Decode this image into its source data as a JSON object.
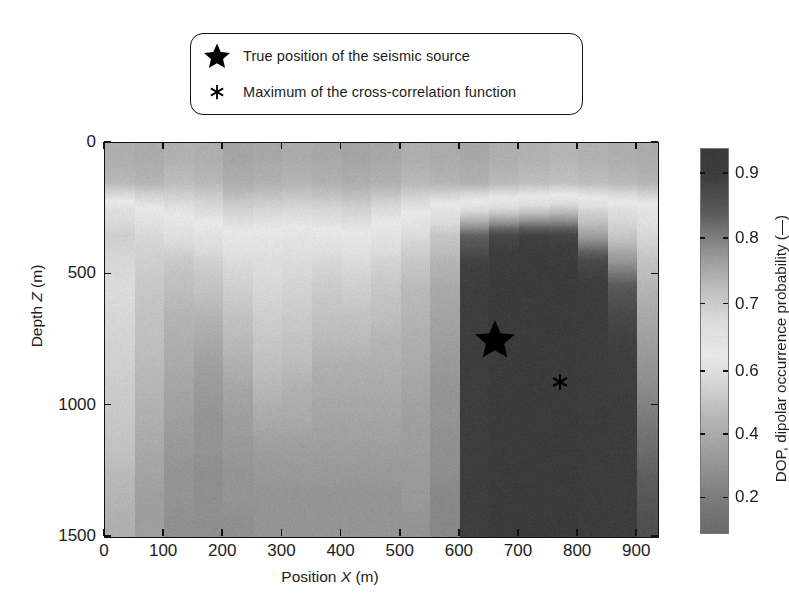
{
  "figure": {
    "legend": {
      "items": [
        {
          "symbol": "star-marker",
          "label": "True position of the seismic source"
        },
        {
          "symbol": "asterisk-marker",
          "label": "Maximum of the cross-correlation function"
        }
      ]
    }
  },
  "chart_data": {
    "type": "heatmap",
    "title": "",
    "xlabel": "Position X (m)",
    "ylabel": "Depth Z (m)",
    "xlabel_prefix": "Position ",
    "xlabel_var": "X",
    "xlabel_unit": " (m)",
    "ylabel_prefix": "Depth ",
    "ylabel_var": "Z",
    "ylabel_unit": " (m)",
    "xlim": [
      0,
      935
    ],
    "ylim": [
      0,
      1500
    ],
    "y_inverted": true,
    "grid": false,
    "xticks": [
      0,
      100,
      200,
      300,
      400,
      500,
      600,
      700,
      800,
      900
    ],
    "xticklabels": [
      "0",
      "100",
      "200",
      "300",
      "400",
      "500",
      "600",
      "700",
      "800",
      "900"
    ],
    "yticks": [
      0,
      500,
      1000,
      1500
    ],
    "yticklabels": [
      "0",
      "500",
      "1000",
      "1500"
    ],
    "colorbar": {
      "label": "DOP, dipolar occurrence probability (—)",
      "ticks": [
        0.9,
        0.8,
        0.7,
        0.6,
        0.4,
        0.2
      ],
      "ticklabels": [
        "0.9",
        "0.8",
        "0.7",
        "0.6",
        "0.4",
        "0.2"
      ],
      "tick_positions_frac": [
        0.065,
        0.235,
        0.405,
        0.58,
        0.745,
        0.91
      ],
      "vmin": 0.1,
      "vmax": 0.95,
      "colormap": "inverted-gray-nonmonotonic",
      "stops": [
        {
          "pos": 0.0,
          "hex": "#3a3a3a"
        },
        {
          "pos": 0.07,
          "hex": "#3d3d3d"
        },
        {
          "pos": 0.17,
          "hex": "#5c5c5c"
        },
        {
          "pos": 0.26,
          "hex": "#8f8f8f"
        },
        {
          "pos": 0.36,
          "hex": "#bdbdbd"
        },
        {
          "pos": 0.45,
          "hex": "#dcdcdc"
        },
        {
          "pos": 0.54,
          "hex": "#e8e8e8"
        },
        {
          "pos": 0.62,
          "hex": "#d2d2d2"
        },
        {
          "pos": 0.71,
          "hex": "#b3b3b3"
        },
        {
          "pos": 0.8,
          "hex": "#9b9b9b"
        },
        {
          "pos": 0.9,
          "hex": "#7e7e7e"
        },
        {
          "pos": 1.0,
          "hex": "#6a6a6a"
        }
      ]
    },
    "x_bin_edges": [
      0,
      50,
      100,
      150,
      200,
      250,
      300,
      350,
      400,
      450,
      500,
      550,
      600,
      650,
      700,
      750,
      800,
      850,
      900,
      935
    ],
    "z_bin_edges": [
      0,
      100,
      200,
      300,
      400,
      500,
      600,
      700,
      800,
      900,
      1000,
      1100,
      1200,
      1300,
      1400,
      1500
    ],
    "values": [
      [
        0.33,
        0.32,
        0.34,
        0.33,
        0.3,
        0.31,
        0.32,
        0.31,
        0.3,
        0.31,
        0.33,
        0.32,
        0.31,
        0.33,
        0.34,
        0.35,
        0.34,
        0.33,
        0.32
      ],
      [
        0.36,
        0.35,
        0.37,
        0.36,
        0.33,
        0.34,
        0.35,
        0.34,
        0.33,
        0.34,
        0.36,
        0.35,
        0.34,
        0.36,
        0.37,
        0.38,
        0.37,
        0.36,
        0.35
      ],
      [
        0.55,
        0.5,
        0.47,
        0.45,
        0.42,
        0.43,
        0.44,
        0.43,
        0.42,
        0.45,
        0.48,
        0.52,
        0.56,
        0.58,
        0.6,
        0.62,
        0.58,
        0.55,
        0.52
      ],
      [
        0.6,
        0.58,
        0.55,
        0.53,
        0.5,
        0.51,
        0.52,
        0.51,
        0.5,
        0.53,
        0.57,
        0.62,
        0.8,
        0.86,
        0.88,
        0.87,
        0.7,
        0.62,
        0.58
      ],
      [
        0.58,
        0.6,
        0.62,
        0.6,
        0.57,
        0.56,
        0.57,
        0.58,
        0.57,
        0.59,
        0.62,
        0.66,
        0.88,
        0.91,
        0.92,
        0.91,
        0.86,
        0.72,
        0.63
      ],
      [
        0.57,
        0.62,
        0.64,
        0.63,
        0.6,
        0.58,
        0.59,
        0.61,
        0.6,
        0.62,
        0.65,
        0.68,
        0.89,
        0.92,
        0.92,
        0.92,
        0.9,
        0.82,
        0.66
      ],
      [
        0.58,
        0.63,
        0.66,
        0.66,
        0.63,
        0.6,
        0.61,
        0.63,
        0.63,
        0.64,
        0.66,
        0.69,
        0.89,
        0.92,
        0.92,
        0.92,
        0.91,
        0.86,
        0.68
      ],
      [
        0.59,
        0.64,
        0.67,
        0.68,
        0.65,
        0.62,
        0.63,
        0.65,
        0.65,
        0.66,
        0.67,
        0.7,
        0.89,
        0.92,
        0.92,
        0.92,
        0.91,
        0.88,
        0.7
      ],
      [
        0.6,
        0.65,
        0.68,
        0.7,
        0.67,
        0.64,
        0.65,
        0.67,
        0.67,
        0.67,
        0.68,
        0.71,
        0.89,
        0.92,
        0.92,
        0.92,
        0.91,
        0.89,
        0.72
      ],
      [
        0.61,
        0.66,
        0.69,
        0.71,
        0.69,
        0.66,
        0.67,
        0.68,
        0.68,
        0.68,
        0.69,
        0.72,
        0.89,
        0.92,
        0.92,
        0.92,
        0.91,
        0.89,
        0.74
      ],
      [
        0.62,
        0.67,
        0.7,
        0.72,
        0.7,
        0.68,
        0.68,
        0.69,
        0.69,
        0.69,
        0.7,
        0.72,
        0.89,
        0.92,
        0.92,
        0.92,
        0.91,
        0.9,
        0.76
      ],
      [
        0.63,
        0.68,
        0.71,
        0.72,
        0.71,
        0.7,
        0.7,
        0.7,
        0.7,
        0.7,
        0.7,
        0.73,
        0.89,
        0.92,
        0.92,
        0.92,
        0.91,
        0.9,
        0.78
      ],
      [
        0.65,
        0.69,
        0.72,
        0.73,
        0.72,
        0.71,
        0.71,
        0.71,
        0.71,
        0.71,
        0.71,
        0.73,
        0.89,
        0.92,
        0.92,
        0.92,
        0.91,
        0.9,
        0.8
      ],
      [
        0.66,
        0.7,
        0.72,
        0.73,
        0.72,
        0.72,
        0.72,
        0.72,
        0.72,
        0.72,
        0.71,
        0.74,
        0.89,
        0.92,
        0.92,
        0.92,
        0.91,
        0.9,
        0.82
      ],
      [
        0.67,
        0.7,
        0.73,
        0.73,
        0.73,
        0.72,
        0.72,
        0.72,
        0.72,
        0.72,
        0.72,
        0.74,
        0.89,
        0.92,
        0.92,
        0.92,
        0.91,
        0.9,
        0.84
      ]
    ],
    "markers": [
      {
        "name": "true-source",
        "symbol": "star",
        "x": 660,
        "z": 750,
        "size": 34
      },
      {
        "name": "xcorr-max",
        "symbol": "asterisk",
        "x": 770,
        "z": 910,
        "size": 17
      }
    ]
  }
}
